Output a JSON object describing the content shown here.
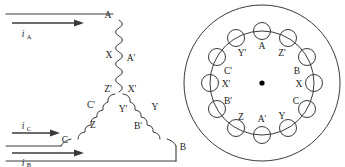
{
  "figure": {
    "stroke_color": "#3a3a3a",
    "text_color": "#1a1a1a",
    "background": "#ffffff"
  },
  "left_diagram": {
    "name": "delta-winding-schematic",
    "terminals": [
      {
        "id": "terminal-a",
        "label": "A"
      },
      {
        "id": "terminal-b",
        "label": "B"
      },
      {
        "id": "terminal-c",
        "label": "C"
      }
    ],
    "currents": [
      {
        "id": "current-a",
        "symbol": "i",
        "subscript": "A",
        "arrow": "right"
      },
      {
        "id": "current-c",
        "symbol": "i",
        "subscript": "C",
        "arrow": "right"
      },
      {
        "id": "current-b",
        "symbol": "i",
        "subscript": "B",
        "arrow": "right"
      }
    ],
    "coil_labels": [
      {
        "id": "coil-label-x",
        "label": "X"
      },
      {
        "id": "coil-label-aprime",
        "label": "A'"
      },
      {
        "id": "coil-label-zprime",
        "label": "Z'"
      },
      {
        "id": "coil-label-xprime",
        "label": "X'"
      },
      {
        "id": "coil-label-cprime",
        "label": "C'"
      },
      {
        "id": "coil-label-yprime",
        "label": "Y'"
      },
      {
        "id": "coil-label-y",
        "label": "Y"
      },
      {
        "id": "coil-label-z",
        "label": "Z"
      },
      {
        "id": "coil-label-bprime",
        "label": "B'"
      }
    ]
  },
  "right_diagram": {
    "name": "stator-cross-section",
    "slot_count": 12,
    "center_marker": "shaft-center-dot",
    "slot_labels": [
      {
        "index": 0,
        "label": "A",
        "angle_deg": -90
      },
      {
        "index": 1,
        "label": "Z'",
        "angle_deg": -60
      },
      {
        "index": 2,
        "label": "B",
        "angle_deg": -30
      },
      {
        "index": 3,
        "label": "X",
        "angle_deg": 0
      },
      {
        "index": 4,
        "label": "C",
        "angle_deg": 30
      },
      {
        "index": 5,
        "label": "Y",
        "angle_deg": 60
      },
      {
        "index": 6,
        "label": "A'",
        "angle_deg": 90
      },
      {
        "index": 7,
        "label": "Z",
        "angle_deg": 120
      },
      {
        "index": 8,
        "label": "B'",
        "angle_deg": 150
      },
      {
        "index": 9,
        "label": "X'",
        "angle_deg": 180
      },
      {
        "index": 10,
        "label": "C'",
        "angle_deg": 210
      },
      {
        "index": 11,
        "label": "Y'",
        "angle_deg": 240
      }
    ]
  }
}
